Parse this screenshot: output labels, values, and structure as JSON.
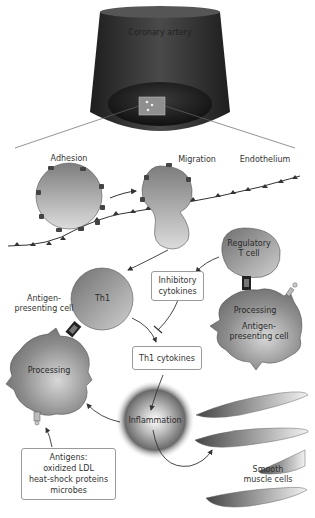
{
  "diagram": {
    "artery_label": "Coronary artery",
    "stages": {
      "adhesion": "Adhesion",
      "migration": "Migration",
      "endothelium": "Endothelium"
    },
    "cells": {
      "regulatory_t_cell": [
        "Regulatory",
        "T cell"
      ],
      "th1": "Th1",
      "apc_left_label": [
        "Antigen-",
        "presenting cell"
      ],
      "apc_left_processing": "Processing",
      "apc_right_processing": "Processing",
      "apc_right_label": [
        "Antigen-",
        "presenting cell"
      ],
      "smooth_muscle": [
        "Smooth",
        "muscle cells"
      ]
    },
    "boxes": {
      "inhibitory_cytokines": [
        "Inhibitory",
        "cytokines"
      ],
      "th1_cytokines": "Th1 cytokines",
      "antigens": [
        "Antigens:",
        "oxidized LDL",
        "heat-shock proteins",
        "microbes"
      ]
    },
    "inflammation_label": "Inflammation",
    "colors": {
      "artery_dark": "#2b2b2b",
      "cell_gray": "#8a8a8a",
      "cell_light": "#d9d9d9",
      "line": "#333333",
      "box_border": "#9a9a9a"
    }
  }
}
